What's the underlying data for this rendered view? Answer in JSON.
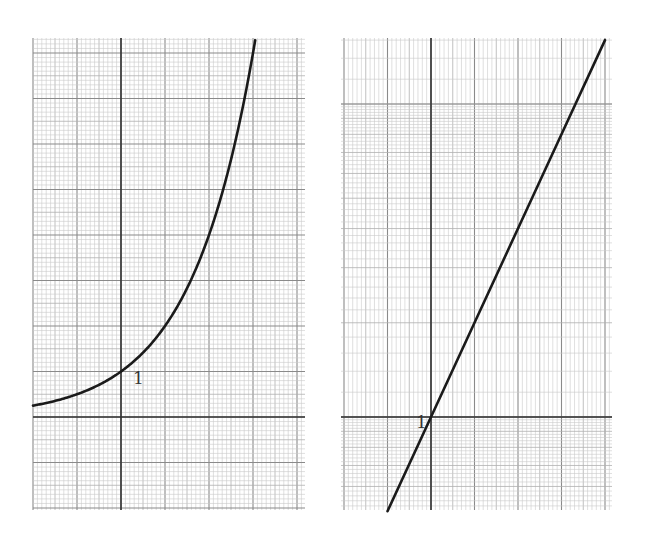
{
  "chart_data": [
    {
      "type": "line",
      "title": "",
      "xlabel": "",
      "ylabel": "",
      "scale": "linear",
      "function": "y = 2^x",
      "xlim": [
        -2,
        4.2
      ],
      "ylim": [
        -2.05,
        8.3
      ],
      "grid": true,
      "series": [
        {
          "name": "2^x",
          "x": [
            -2,
            -1.5,
            -1,
            -0.5,
            0,
            0.5,
            1,
            1.5,
            2,
            2.5,
            3,
            3.05
          ],
          "values": [
            0.25,
            0.354,
            0.5,
            0.707,
            1,
            1.414,
            2,
            2.828,
            4,
            5.657,
            8,
            8.28
          ]
        }
      ],
      "annotations": [
        {
          "text": "1",
          "x": 0,
          "y": 1
        }
      ]
    },
    {
      "type": "line",
      "title": "",
      "xlabel": "",
      "ylabel": "",
      "scale": "semilog-y",
      "function": "y = 2^x",
      "xlim": [
        -1.95,
        4.1
      ],
      "ylim": [
        0.5,
        16.5
      ],
      "grid": true,
      "series": [
        {
          "name": "2^x (log scale)",
          "x": [
            -1,
            0,
            1,
            2,
            3,
            4
          ],
          "values": [
            0.5,
            1,
            2,
            4,
            8,
            16
          ]
        }
      ],
      "annotations": [
        {
          "text": "1",
          "x": 0,
          "y": 1
        }
      ]
    }
  ]
}
